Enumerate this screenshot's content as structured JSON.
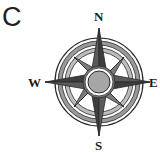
{
  "panel": {
    "label": "C"
  },
  "compass": {
    "icon": "compass-rose-icon",
    "directions": {
      "north": "N",
      "south": "S",
      "east": "E",
      "west": "W"
    },
    "colors": {
      "star_dark": "#4a4a4a",
      "star_mid": "#7a7a7a",
      "ring": "#8c8c8c",
      "ring_light": "#cfcfcf",
      "center_fill": "#a6a6a6",
      "center_ring": "#ffffff",
      "outline": "#2a2a2a"
    }
  }
}
